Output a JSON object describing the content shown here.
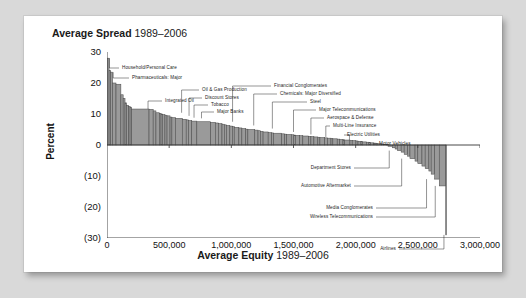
{
  "card": {
    "background": "#ffffff",
    "page_background": "#d9d9d9"
  },
  "titles": {
    "chart_title_bold": "Average Spread",
    "chart_title_years": "1989–2006",
    "xaxis_title_bold": "Average Equity",
    "xaxis_title_years": "1989–2006",
    "yaxis_title": "Percent"
  },
  "chart_data": {
    "type": "bar",
    "title": "Average Spread 1989–2006",
    "xlabel": "Average Equity 1989–2006",
    "ylabel": "Percent",
    "xlim": [
      0,
      3000000
    ],
    "ylim": [
      -30,
      30
    ],
    "grid": false,
    "legend": "none",
    "bar_fill": "#9a9a9a",
    "bar_stroke": "#4d4d4d",
    "axis_color": "#333333",
    "note": "Variable-width (marimekko style) bars: width = average equity of industry, height = average spread percent. Bars sorted descending by spread; x is cumulative equity.",
    "xticks": [
      0,
      500000,
      1000000,
      1500000,
      2000000,
      2500000,
      3000000
    ],
    "xticklabels": [
      "0",
      "500,000",
      "1,000,000",
      "1,500,000",
      "2,000,000",
      "2,500,000",
      "3,000,000"
    ],
    "yticks": [
      30,
      20,
      10,
      0,
      -10,
      -20,
      -30
    ],
    "yticklabels": [
      "30",
      "20",
      "10",
      "0",
      "(10)",
      "(20)",
      "(30)"
    ],
    "bars": [
      {
        "width": 18000,
        "value": 28.0
      },
      {
        "width": 14000,
        "value": 24.0
      },
      {
        "width": 16000,
        "value": 23.5
      },
      {
        "width": 30000,
        "value": 20.0
      },
      {
        "width": 42000,
        "value": 19.6
      },
      {
        "width": 20000,
        "value": 16.2
      },
      {
        "width": 16000,
        "value": 15.0
      },
      {
        "width": 14000,
        "value": 13.6
      },
      {
        "width": 18000,
        "value": 12.8
      },
      {
        "width": 12000,
        "value": 12.4
      },
      {
        "width": 14000,
        "value": 12.2
      },
      {
        "width": 150000,
        "value": 11.6
      },
      {
        "width": 36000,
        "value": 11.5
      },
      {
        "width": 24000,
        "value": 11.0
      },
      {
        "width": 30000,
        "value": 10.4
      },
      {
        "width": 14000,
        "value": 10.2
      },
      {
        "width": 12000,
        "value": 10.0
      },
      {
        "width": 22000,
        "value": 9.8
      },
      {
        "width": 18000,
        "value": 9.6
      },
      {
        "width": 26000,
        "value": 9.4
      },
      {
        "width": 16000,
        "value": 9.0
      },
      {
        "width": 30000,
        "value": 8.8
      },
      {
        "width": 60000,
        "value": 8.6
      },
      {
        "width": 34000,
        "value": 8.3
      },
      {
        "width": 20000,
        "value": 8.1
      },
      {
        "width": 28000,
        "value": 7.9
      },
      {
        "width": 44000,
        "value": 7.7
      },
      {
        "width": 120000,
        "value": 7.5
      },
      {
        "width": 40000,
        "value": 7.3
      },
      {
        "width": 26000,
        "value": 7.1
      },
      {
        "width": 32000,
        "value": 6.9
      },
      {
        "width": 20000,
        "value": 6.7
      },
      {
        "width": 18000,
        "value": 6.5
      },
      {
        "width": 30000,
        "value": 6.3
      },
      {
        "width": 22000,
        "value": 6.1
      },
      {
        "width": 16000,
        "value": 5.9
      },
      {
        "width": 40000,
        "value": 5.7
      },
      {
        "width": 26000,
        "value": 5.5
      },
      {
        "width": 34000,
        "value": 5.3
      },
      {
        "width": 18000,
        "value": 5.1
      },
      {
        "width": 60000,
        "value": 5.0
      },
      {
        "width": 28000,
        "value": 4.8
      },
      {
        "width": 20000,
        "value": 4.6
      },
      {
        "width": 24000,
        "value": 4.4
      },
      {
        "width": 44000,
        "value": 4.2
      },
      {
        "width": 30000,
        "value": 4.0
      },
      {
        "width": 16000,
        "value": 3.9
      },
      {
        "width": 70000,
        "value": 3.8
      },
      {
        "width": 26000,
        "value": 3.6
      },
      {
        "width": 18000,
        "value": 3.5
      },
      {
        "width": 40000,
        "value": 3.4
      },
      {
        "width": 22000,
        "value": 3.3
      },
      {
        "width": 14000,
        "value": 3.2
      },
      {
        "width": 36000,
        "value": 3.1
      },
      {
        "width": 28000,
        "value": 3.0
      },
      {
        "width": 50000,
        "value": 2.9
      },
      {
        "width": 20000,
        "value": 2.8
      },
      {
        "width": 26000,
        "value": 2.7
      },
      {
        "width": 34000,
        "value": 2.6
      },
      {
        "width": 18000,
        "value": 2.5
      },
      {
        "width": 42000,
        "value": 2.4
      },
      {
        "width": 24000,
        "value": 2.3
      },
      {
        "width": 30000,
        "value": 2.2
      },
      {
        "width": 16000,
        "value": 2.1
      },
      {
        "width": 38000,
        "value": 2.0
      },
      {
        "width": 22000,
        "value": 1.9
      },
      {
        "width": 28000,
        "value": 1.8
      },
      {
        "width": 14000,
        "value": 1.7
      },
      {
        "width": 46000,
        "value": 1.6
      },
      {
        "width": 20000,
        "value": 1.5
      },
      {
        "width": 32000,
        "value": 1.4
      },
      {
        "width": 18000,
        "value": 1.3
      },
      {
        "width": 26000,
        "value": 1.2
      },
      {
        "width": 12000,
        "value": 1.1
      },
      {
        "width": 34000,
        "value": 1.0
      },
      {
        "width": 22000,
        "value": 0.9
      },
      {
        "width": 16000,
        "value": 0.8
      },
      {
        "width": 28000,
        "value": 0.7
      },
      {
        "width": 20000,
        "value": 0.6
      },
      {
        "width": 14000,
        "value": 0.5
      },
      {
        "width": 30000,
        "value": 0.4
      },
      {
        "width": 18000,
        "value": 0.3
      },
      {
        "width": 24000,
        "value": 0.2
      },
      {
        "width": 16000,
        "value": 0.1
      },
      {
        "width": 40000,
        "value": -0.4
      },
      {
        "width": 22000,
        "value": -0.9
      },
      {
        "width": 18000,
        "value": -1.3
      },
      {
        "width": 34000,
        "value": -1.8
      },
      {
        "width": 26000,
        "value": -2.3
      },
      {
        "width": 30000,
        "value": -3.0
      },
      {
        "width": 20000,
        "value": -3.6
      },
      {
        "width": 44000,
        "value": -4.4
      },
      {
        "width": 24000,
        "value": -5.2
      },
      {
        "width": 36000,
        "value": -6.0
      },
      {
        "width": 28000,
        "value": -6.8
      },
      {
        "width": 32000,
        "value": -7.6
      },
      {
        "width": 20000,
        "value": -8.4
      },
      {
        "width": 30000,
        "value": -9.4
      },
      {
        "width": 40000,
        "value": -11.0
      },
      {
        "width": 56000,
        "value": -13.2
      },
      {
        "width": 6000,
        "value": -29.0
      }
    ],
    "annotations": [
      {
        "label": "Household/Personal Care",
        "value": 28.0,
        "approx_equity": 20000
      },
      {
        "label": "Pharmaceuticals: Major",
        "value": 23.5,
        "approx_equity": 50000
      },
      {
        "label": "Integrated Oil",
        "value": 11.6,
        "approx_equity": 330000
      },
      {
        "label": "Oil & Gas Production",
        "value": 10.4,
        "approx_equity": 600000
      },
      {
        "label": "Discount Stores",
        "value": 9.4,
        "approx_equity": 660000
      },
      {
        "label": "Tobacco",
        "value": 8.8,
        "approx_equity": 700000
      },
      {
        "label": "Major Banks",
        "value": 8.6,
        "approx_equity": 760000
      },
      {
        "label": "Financial Conglomerates",
        "value": 7.5,
        "approx_equity": 1010000
      },
      {
        "label": "Chemicals: Major Diversified",
        "value": 6.3,
        "approx_equity": 1180000
      },
      {
        "label": "Steel",
        "value": 5.3,
        "approx_equity": 1330000
      },
      {
        "label": "Major Telecommunications",
        "value": 4.2,
        "approx_equity": 1500000
      },
      {
        "label": "Aerospace & Defense",
        "value": 3.4,
        "approx_equity": 1640000
      },
      {
        "label": "Multi-Line Insurance",
        "value": 2.6,
        "approx_equity": 1760000
      },
      {
        "label": "Electric Utilities",
        "value": 1.6,
        "approx_equity": 1950000
      },
      {
        "label": "Motor Vehicles",
        "value": 0.4,
        "approx_equity": 2140000
      },
      {
        "label": "Department Stores",
        "value": -1.8,
        "approx_equity": 2270000
      },
      {
        "label": "Automotive Aftermarket",
        "value": -4.4,
        "approx_equity": 2370000
      },
      {
        "label": "Media Conglomerates",
        "value": -11.0,
        "approx_equity": 2570000
      },
      {
        "label": "Wireless Telecommunications",
        "value": -13.2,
        "approx_equity": 2640000
      },
      {
        "label": "Airlines",
        "value": -29.0,
        "approx_equity": 2710000
      }
    ]
  }
}
